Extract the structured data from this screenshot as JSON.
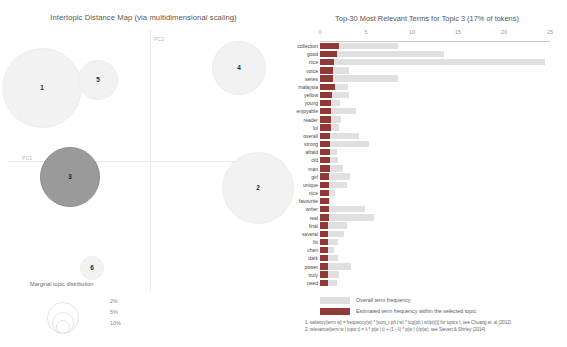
{
  "intertopic_map": {
    "title": "Intertopic Distance Map (via multidimensional scaling)",
    "axis_labels": {
      "x": "PC1",
      "y": "PC2"
    },
    "selected_topic": 3,
    "topics": [
      {
        "id": 1,
        "label": "1",
        "cx": 42,
        "cy": 88,
        "r": 40,
        "selected": false
      },
      {
        "id": 5,
        "label": "5",
        "cx": 98,
        "cy": 80,
        "r": 20,
        "selected": false
      },
      {
        "id": 3,
        "label": "3",
        "cx": 70,
        "cy": 177,
        "r": 30,
        "selected": true
      },
      {
        "id": 6,
        "label": "6",
        "cx": 92,
        "cy": 268,
        "r": 12,
        "selected": false
      },
      {
        "id": 4,
        "label": "4",
        "cx": 239,
        "cy": 68,
        "r": 27,
        "selected": false
      },
      {
        "id": 2,
        "label": "2",
        "cx": 258,
        "cy": 188,
        "r": 36,
        "selected": false
      }
    ],
    "marginal_legend": {
      "title": "Marginal topic distribution",
      "items": [
        {
          "label": "2%",
          "r": 6
        },
        {
          "label": "5%",
          "r": 10
        },
        {
          "label": "10%",
          "r": 15
        }
      ]
    }
  },
  "barchart": {
    "title": "Top-30 Most Relevant Terms for Topic 3 (17% of tokens)",
    "legend": {
      "overall": "Overall term frequency",
      "estimated": "Estimated term frequency within the selected topic"
    },
    "footnotes": [
      "1. saliency(term w) = frequency(w) * [sum_t p(t | w) * log(p(t | w)/p(t))] for topics t; see Chuang et. al (2012)",
      "2. relevance(term w | topic t) = λ * p(w | t) + (1 - λ) * p(w | t)/p(w); see Sievert & Shirley (2014)"
    ]
  },
  "chart_data": {
    "type": "bar",
    "title": "Top-30 Most Relevant Terms for Topic 3 (17% of tokens)",
    "xlabel": "",
    "ylabel": "",
    "xlim": [
      0,
      25
    ],
    "xticks": [
      0,
      5,
      10,
      15,
      20,
      25
    ],
    "grid": false,
    "orientation": "horizontal",
    "legend_position": "bottom",
    "categories": [
      "collection",
      "good",
      "nice",
      "voice",
      "series",
      "malaysia",
      "yellow",
      "young",
      "enjoyable",
      "reader",
      "lol",
      "overall",
      "strong",
      "afraid",
      "old",
      "man",
      "girl",
      "unique",
      "nice",
      "favourite",
      "writer",
      "real",
      "final",
      "several",
      "fix",
      "chen",
      "dark",
      "power",
      "truly",
      "need"
    ],
    "series": [
      {
        "name": "Overall term frequency",
        "values": [
          8.5,
          13.5,
          24.5,
          3.2,
          8.5,
          3.0,
          3.2,
          2.2,
          3.9,
          2.3,
          2.1,
          4.2,
          5.3,
          1.9,
          2.0,
          2.5,
          3.3,
          2.9,
          1.6,
          1.1,
          4.9,
          5.9,
          2.9,
          2.6,
          2.0,
          1.5,
          2.0,
          3.4,
          2.1,
          1.9
        ]
      },
      {
        "name": "Estimated term frequency within the selected topic",
        "values": [
          2.1,
          1.8,
          1.5,
          1.4,
          1.4,
          1.6,
          1.3,
          1.2,
          1.2,
          1.2,
          1.2,
          1.1,
          1.1,
          1.1,
          1.1,
          1.1,
          1.0,
          1.0,
          1.0,
          1.0,
          1.0,
          1.0,
          0.9,
          0.9,
          0.9,
          0.9,
          0.9,
          0.9,
          0.9,
          0.9
        ]
      }
    ]
  }
}
